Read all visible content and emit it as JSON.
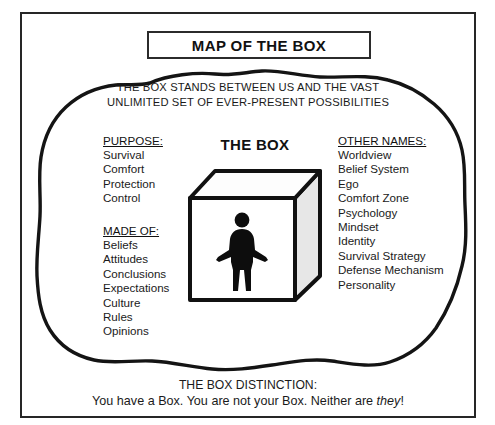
{
  "document": {
    "title": "MAP OF THE BOX",
    "subtitle_line1": "THE BOX STANDS BETWEEN US AND THE VAST",
    "subtitle_line2": "UNLIMITED SET OF EVER-PRESENT POSSIBILITIES"
  },
  "center": {
    "box_label": "THE BOX",
    "figure_icon": "person-standing-icon",
    "cube_icon": "cube-icon"
  },
  "columns": {
    "purpose": {
      "heading": "PURPOSE:",
      "items": [
        "Survival",
        "Comfort",
        "Protection",
        "Control"
      ]
    },
    "made_of": {
      "heading": "MADE OF:",
      "items": [
        "Beliefs",
        "Attitudes",
        "Conclusions",
        "Expectations",
        "Culture",
        "Rules",
        "Opinions"
      ]
    },
    "other_names": {
      "heading": "OTHER NAMES:",
      "items": [
        "Worldview",
        "Belief System",
        "Ego",
        "Comfort Zone",
        "Psychology",
        "Mindset",
        "Identity",
        "Survival Strategy",
        "Defense Mechanism",
        "Personality"
      ]
    }
  },
  "footer": {
    "heading": "THE BOX DISTINCTION:",
    "line_prefix": "You have a Box. You are not your Box. Neither are ",
    "line_italic": "they",
    "line_suffix": "!"
  },
  "colors": {
    "ink": "#1a1a1a",
    "outline": "#111111",
    "cube_front": "#ffffff",
    "cube_top": "#fdfdfd",
    "cube_side": "#e7e7e7",
    "background": "#ffffff"
  }
}
